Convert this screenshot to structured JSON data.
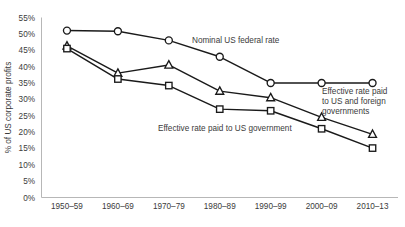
{
  "chart_data": {
    "type": "line",
    "title": "",
    "xlabel": "",
    "ylabel": "% of US corporate profits",
    "categories": [
      "1950–59",
      "1960–69",
      "1970–79",
      "1980–89",
      "1990–99",
      "2000–09",
      "2010–13"
    ],
    "ylim": [
      0,
      55
    ],
    "ytick_labels": [
      "0%",
      "5%",
      "10%",
      "15%",
      "20%",
      "25%",
      "30%",
      "35%",
      "40%",
      "45%",
      "50%",
      "55%"
    ],
    "ytick_values": [
      0,
      5,
      10,
      15,
      20,
      25,
      30,
      35,
      40,
      45,
      50,
      55
    ],
    "grid": false,
    "legend_position": "inline-annotations",
    "series": [
      {
        "name": "Nominal US federal rate",
        "marker": "circle",
        "color": "#1a1a1a",
        "values": [
          51,
          50.8,
          48,
          43,
          35,
          35,
          35
        ]
      },
      {
        "name": "Effective rate paid to US and foreign governments",
        "marker": "triangle",
        "color": "#1a1a1a",
        "values": [
          46.3,
          38,
          40.5,
          32.5,
          30.5,
          24.5,
          19.3
        ]
      },
      {
        "name": "Effective rate paid to US government",
        "marker": "square",
        "color": "#1a1a1a",
        "values": [
          45.5,
          36.2,
          34.2,
          27,
          26.5,
          21,
          15.1
        ]
      }
    ],
    "annotations": [
      {
        "id": "nominal",
        "lines": [
          "Nominal US federal rate"
        ],
        "x": 192,
        "y": 43
      },
      {
        "id": "us-and-foreign",
        "lines": [
          "Effective rate paid",
          "to US and foreign",
          "governments"
        ],
        "x": 322,
        "y": 94
      },
      {
        "id": "us-government",
        "lines": [
          "Effective rate paid to US government"
        ],
        "x": 158,
        "y": 131
      }
    ]
  }
}
